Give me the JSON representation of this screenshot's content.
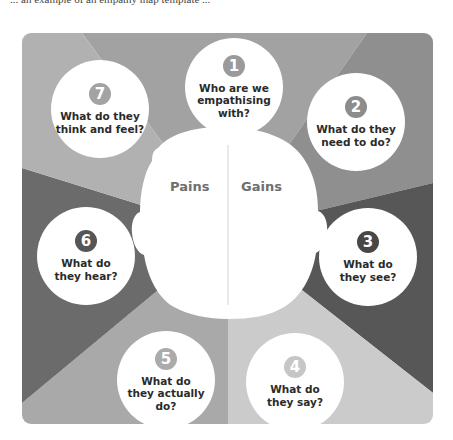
{
  "top_text": "... an example of an empathy map template ...",
  "diagram": {
    "title": "Empathy map",
    "head": {
      "left_label": "Pains",
      "right_label": "Gains"
    },
    "segments": [
      {
        "number": "1",
        "question": "Who are we empathising with?",
        "lines": [
          "Who are we",
          "empathising",
          "with?"
        ],
        "segment_color": "#a2a2a2",
        "badge_color": "#9a9a9a"
      },
      {
        "number": "2",
        "question": "What do they need to do?",
        "lines": [
          "What do they",
          "need to do?"
        ],
        "segment_color": "#8f8f8f",
        "badge_color": "#8c8c8c"
      },
      {
        "number": "3",
        "question": "What do they see?",
        "lines": [
          "What do",
          "they see?"
        ],
        "segment_color": "#575757",
        "badge_color": "#474747"
      },
      {
        "number": "4",
        "question": "What do they say?",
        "lines": [
          "What do",
          "they say?"
        ],
        "segment_color": "#cbcbcb",
        "badge_color": "#c6c6c6"
      },
      {
        "number": "5",
        "question": "What do they actually do?",
        "lines": [
          "What do",
          "they actually",
          "do?"
        ],
        "segment_color": "#a9a9a9",
        "badge_color": "#ababab"
      },
      {
        "number": "6",
        "question": "What do they hear?",
        "lines": [
          "What do",
          "they hear?"
        ],
        "segment_color": "#6b6b6b",
        "badge_color": "#565656"
      },
      {
        "number": "7",
        "question": "What do they think and feel?",
        "lines": [
          "What do they",
          "think and feel?"
        ],
        "segment_color": "#b1b1b1",
        "badge_color": "#a3a3a3"
      }
    ]
  }
}
